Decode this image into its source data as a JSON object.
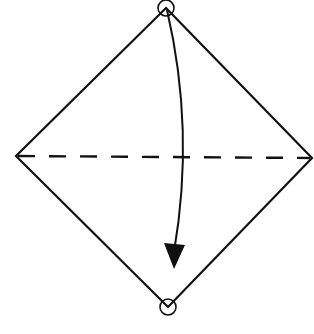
{
  "diagram": {
    "type": "origami-fold-instruction",
    "stroke_color": "#111111",
    "background": "#ffffff",
    "shape": {
      "kind": "diamond",
      "vertices": {
        "top": [
          166,
          8
        ],
        "right": [
          312,
          158
        ],
        "bottom": [
          168,
          307
        ],
        "left": [
          16,
          156
        ]
      }
    },
    "fold_line": {
      "style": "dashed",
      "from": [
        16,
        156
      ],
      "to": [
        312,
        158
      ]
    },
    "markers": [
      {
        "name": "top-corner-circle",
        "center": [
          166,
          8
        ],
        "radius": 8
      },
      {
        "name": "bottom-corner-circle",
        "center": [
          168,
          307
        ],
        "radius": 8
      }
    ],
    "arrow": {
      "meaning": "fold top corner down to bottom corner",
      "start": [
        167,
        10
      ],
      "control": [
        195,
        140
      ],
      "end": [
        174,
        250
      ],
      "head_tip": [
        174,
        268
      ]
    }
  }
}
